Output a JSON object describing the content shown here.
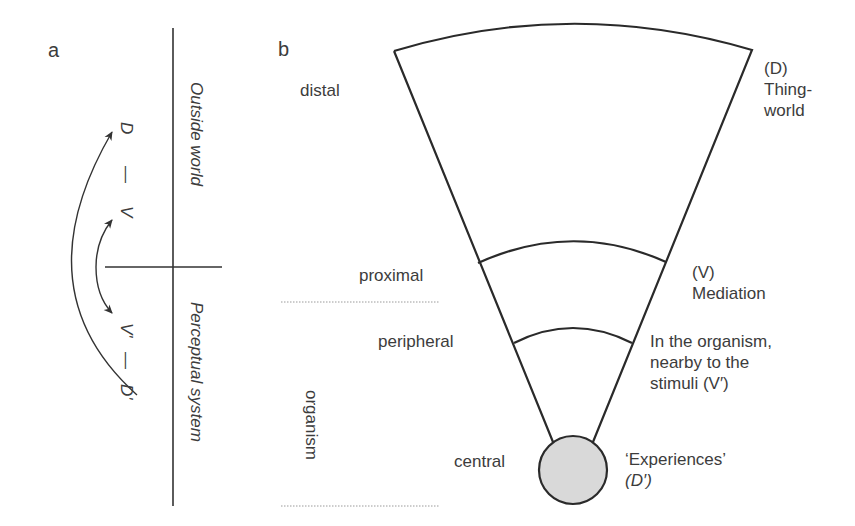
{
  "panel_a": {
    "label": "a",
    "outside_world": "Outside world",
    "perceptual_system": "Perceptual system",
    "top_chain": {
      "d": "D",
      "dash": "—",
      "v": "V"
    },
    "bottom_chain": {
      "v_prime": "V'",
      "dash": "—",
      "d_prime": "D'"
    }
  },
  "panel_b": {
    "label": "b",
    "levels": {
      "distal": "distal",
      "proximal": "proximal",
      "peripheral": "peripheral",
      "organism": "organism",
      "central": "central"
    },
    "annotations": {
      "thing_world": {
        "line1": "(D)",
        "line2": "Thing-",
        "line3": "world"
      },
      "mediation": {
        "line1": "(V)",
        "line2": "Mediation"
      },
      "in_organism": {
        "line1": "In the organism,",
        "line2": "nearby to the",
        "line3": "stimuli (V′)"
      },
      "experiences": {
        "line1": "‘Experiences’",
        "line2": "(D′)"
      }
    },
    "colors": {
      "stroke": "#2a2a2a",
      "circle_fill": "#d9d9d9",
      "dotted": "#9a9a9a"
    }
  }
}
